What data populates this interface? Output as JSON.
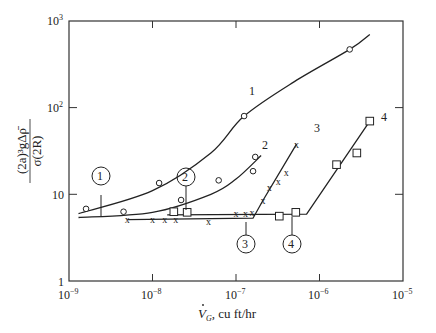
{
  "chart_data": {
    "type": "scatter",
    "title": "",
    "xlabel": "V̇_G, cu ft/hr",
    "ylabel": "(2a)^3 g Δρ̄ / σ(2R)",
    "xscale": "log",
    "yscale": "log",
    "xlim": [
      1e-09,
      1e-05
    ],
    "ylim": [
      1,
      1000
    ],
    "grid": false,
    "legend": "none (curves labeled inline 1–4; circled markers 1–4 on curves)",
    "x_ticks": [
      "10^-9",
      "10^-8",
      "10^-7",
      "10^-6",
      "10^-5"
    ],
    "y_ticks": [
      "1",
      "10",
      "10^2",
      "10^3"
    ],
    "series": [
      {
        "name": "1",
        "marker": "circle",
        "points": [
          [
            1.6e-09,
            6.8
          ],
          [
            4.5e-09,
            6.3
          ],
          [
            1.2e-08,
            13.5
          ],
          [
            6.2e-08,
            14.5
          ],
          [
            1.25e-07,
            80
          ],
          [
            2.3e-06,
            470
          ]
        ],
        "fit_curve": [
          [
            1.3e-09,
            6.0
          ],
          [
            1e-08,
            11
          ],
          [
            5e-08,
            30
          ],
          [
            1.25e-07,
            80
          ],
          [
            5e-07,
            200
          ],
          [
            2.3e-06,
            470
          ],
          [
            4e-06,
            700
          ]
        ]
      },
      {
        "name": "2",
        "marker": "circle",
        "points": [
          [
            2.2e-08,
            8.6
          ],
          [
            1.6e-07,
            18.5
          ],
          [
            1.7e-07,
            27
          ]
        ],
        "fit_curve": [
          [
            1.3e-09,
            5.4
          ],
          [
            1e-08,
            6.2
          ],
          [
            5e-08,
            10
          ],
          [
            1e-07,
            15
          ],
          [
            2e-07,
            28
          ]
        ]
      },
      {
        "name": "3",
        "marker": "x",
        "points": [
          [
            5e-09,
            5.1
          ],
          [
            1e-08,
            5.1
          ],
          [
            1.4e-08,
            5.1
          ],
          [
            1.9e-08,
            5.1
          ],
          [
            4.7e-08,
            4.9
          ],
          [
            1e-07,
            6
          ],
          [
            1.3e-07,
            6
          ],
          [
            1.55e-07,
            6.1
          ],
          [
            2.1e-07,
            8.5
          ],
          [
            2.5e-07,
            12
          ],
          [
            3.2e-07,
            14
          ],
          [
            4e-07,
            18
          ],
          [
            5.3e-07,
            38
          ]
        ],
        "fit_curve": [
          [
            5e-09,
            5.1
          ],
          [
            1.6e-07,
            5.3
          ],
          [
            2.1e-07,
            8.5
          ],
          [
            5.3e-07,
            38
          ]
        ]
      },
      {
        "name": "4",
        "marker": "square",
        "points": [
          [
            1.8e-08,
            6.3
          ],
          [
            2.6e-08,
            6.2
          ],
          [
            3.3e-07,
            5.6
          ],
          [
            5.2e-07,
            6.2
          ],
          [
            1.6e-06,
            22
          ],
          [
            2.8e-06,
            30
          ],
          [
            4e-06,
            70
          ]
        ],
        "fit_curve": [
          [
            1.5e-08,
            5.8
          ],
          [
            7e-07,
            5.9
          ],
          [
            4e-06,
            70
          ]
        ]
      }
    ],
    "annotations": [
      {
        "text": "1",
        "type": "circled",
        "x": 2.2e-09,
        "y": 14
      },
      {
        "text": "2",
        "type": "circled",
        "x": 2.4e-08,
        "y": 14
      },
      {
        "text": "3",
        "type": "circled",
        "x": 1.6e-07,
        "y": 2.8
      },
      {
        "text": "4",
        "type": "circled",
        "x": 5.2e-07,
        "y": 2.8
      }
    ]
  },
  "labels": {
    "x_axis_title_main": "V",
    "x_axis_title_sub": "G",
    "x_axis_title_rest": ", cu ft/hr",
    "y_axis_numerator": "(2a)³gΔρ̄",
    "y_axis_denominator": "σ(2R)",
    "x_ticks": [
      "10",
      "10",
      "10",
      "10",
      "10"
    ],
    "x_tick_exps": [
      "−9",
      "−8",
      "−7",
      "−6",
      "−5"
    ],
    "y_tick_10_3_base": "10",
    "y_tick_10_3_exp": "3",
    "y_tick_10_2_base": "10",
    "y_tick_10_2_exp": "2",
    "y_tick_10": "10",
    "y_tick_1": "1",
    "curve_labels": [
      "1",
      "2",
      "3",
      "4"
    ],
    "circle_labels": [
      "1",
      "2",
      "3",
      "4"
    ]
  }
}
